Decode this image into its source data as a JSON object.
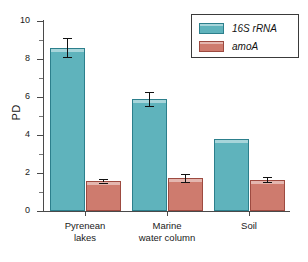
{
  "chart_data": {
    "type": "bar",
    "title": "",
    "xlabel": "",
    "ylabel": "PD",
    "ylim": [
      0,
      10
    ],
    "ytick_values": [
      0,
      2,
      4,
      6,
      8,
      10
    ],
    "ytick_labels": [
      "0",
      "2",
      "4",
      "6",
      "8",
      "10"
    ],
    "yminor_values": [
      1,
      3,
      5,
      7,
      9
    ],
    "grid": false,
    "legend_position": "top-right",
    "categories": [
      "Pyrenean lakes",
      "Marine water column",
      "Soil"
    ],
    "category_lines": [
      [
        "Pyrenean",
        "lakes"
      ],
      [
        "Marine",
        "water column"
      ],
      [
        "Soil",
        ""
      ]
    ],
    "series": [
      {
        "name": "16S rRNA",
        "color": "#5fb3bc",
        "edge_color": "#2c7f8c",
        "values": [
          8.6,
          5.9,
          3.8
        ],
        "errors": [
          0.5,
          0.35,
          0.0
        ]
      },
      {
        "name": "amoA",
        "color": "#ce7b6e",
        "edge_color": "#9d4a40",
        "values": [
          1.6,
          1.75,
          1.65
        ],
        "errors": [
          0.1,
          0.2,
          0.12
        ]
      }
    ]
  },
  "legend": {
    "entries": [
      {
        "label": "16S rRNA",
        "swatch": "teal"
      },
      {
        "label": "amoA",
        "swatch": "salmon"
      }
    ]
  },
  "axis": {
    "y_title": "PD"
  }
}
